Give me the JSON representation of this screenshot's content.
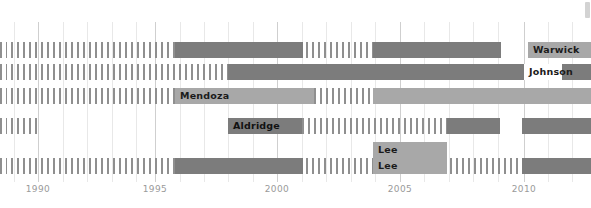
{
  "chart_data": {
    "type": "bar",
    "chart_kind": "timeline-gantt",
    "title": "",
    "xlabel": "",
    "ylabel": "",
    "xlim": [
      1988.45,
      1990,
      2012.75
    ],
    "axis_ticks": [
      {
        "label": "1990",
        "value": 1990,
        "x": 38,
        "major": true
      },
      {
        "label": "1995",
        "value": 1995,
        "x": 155,
        "major": true
      },
      {
        "label": "2000",
        "value": 2000,
        "x": 277,
        "major": true
      },
      {
        "label": "2005",
        "value": 2005,
        "x": 400,
        "major": true
      },
      {
        "label": "2010",
        "value": 2010,
        "x": 524,
        "major": true
      }
    ],
    "minor_gridline_x": [
      14,
      63,
      87,
      112,
      136,
      180,
      204,
      228,
      253,
      302,
      326,
      351,
      375,
      424,
      449,
      473,
      498,
      548,
      572
    ],
    "grid": true,
    "legend": "none",
    "colors": {
      "solid_bar": "#7c7c7c",
      "light_bar": "#a8a8a8",
      "hatch_bar": "#8f8f8f",
      "gridline_minor": "#e8e8e8",
      "gridline_major": "#cfcfcf",
      "axis_text": "#9a9a9a",
      "label_text": "#1b1b1b",
      "background": "#ffffff"
    },
    "rows": [
      {
        "name": "Warwick",
        "label": "Warwick",
        "y": 42,
        "segments": [
          {
            "kind": "hatch",
            "x": 0,
            "w": 7
          },
          {
            "kind": "hatch",
            "x": 11,
            "w": 164
          },
          {
            "kind": "solid",
            "x": 175,
            "w": 128
          },
          {
            "kind": "hatch",
            "x": 306,
            "w": 67
          },
          {
            "kind": "solid",
            "x": 373,
            "w": 128
          },
          {
            "kind": "light",
            "x": 528,
            "w": 63
          }
        ],
        "label_x": 528,
        "label_w": 63,
        "label_style": "on-light"
      },
      {
        "name": "Johnson",
        "label": "Johnson",
        "y": 64,
        "segments": [
          {
            "kind": "hatch",
            "x": 0,
            "w": 7
          },
          {
            "kind": "hatch",
            "x": 11,
            "w": 217
          },
          {
            "kind": "solid",
            "x": 228,
            "w": 363
          }
        ],
        "label_x": 524,
        "label_w": 38,
        "label_style": "on-white"
      },
      {
        "name": "Mendoza",
        "label": "Mendoza",
        "y": 88,
        "segments": [
          {
            "kind": "hatch",
            "x": 0,
            "w": 7
          },
          {
            "kind": "hatch",
            "x": 11,
            "w": 164
          },
          {
            "kind": "light",
            "x": 175,
            "w": 139
          },
          {
            "kind": "hatch",
            "x": 314,
            "w": 59
          },
          {
            "kind": "light",
            "x": 373,
            "w": 218
          }
        ],
        "label_x": 175,
        "label_w": 66,
        "label_style": "on-light"
      },
      {
        "name": "Aldridge",
        "label": "Aldridge",
        "y": 118,
        "segments": [
          {
            "kind": "hatch",
            "x": 0,
            "w": 7
          },
          {
            "kind": "hatch",
            "x": 11,
            "w": 30
          },
          {
            "kind": "solid",
            "x": 228,
            "w": 74
          },
          {
            "kind": "hatch",
            "x": 302,
            "w": 145
          },
          {
            "kind": "solid",
            "x": 447,
            "w": 53
          },
          {
            "kind": "solid",
            "x": 522,
            "w": 69
          }
        ],
        "label_x": 228,
        "label_w": 74,
        "label_style": "on-solid"
      },
      {
        "name": "Lee",
        "label": "Lee",
        "y": 158,
        "segments": [
          {
            "kind": "hatch",
            "x": 0,
            "w": 7
          },
          {
            "kind": "hatch",
            "x": 11,
            "w": 164
          },
          {
            "kind": "solid",
            "x": 175,
            "w": 128
          },
          {
            "kind": "hatch",
            "x": 306,
            "w": 216
          },
          {
            "kind": "solid",
            "x": 522,
            "w": 69
          }
        ],
        "label_x": 373,
        "label_w": 74,
        "label_style": "on-light"
      }
    ],
    "extra_labels": [
      {
        "name": "Lee",
        "text": "Lee",
        "x": 373,
        "y": 142,
        "w": 74,
        "style": "on-light"
      }
    ]
  }
}
